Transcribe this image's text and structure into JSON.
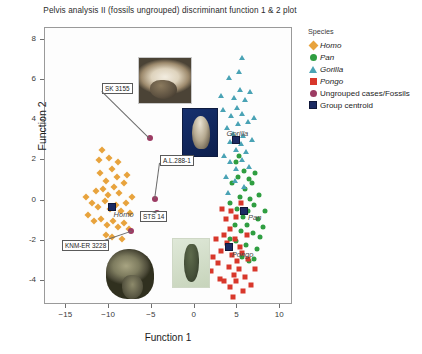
{
  "chart_data": {
    "type": "scatter",
    "title": "Pelvis analysis II (fossils ungrouped) discriminant function 1 & 2 plot",
    "xlabel": "Function 1",
    "ylabel": "Function 2",
    "xlim": [
      -17.5,
      11.5
    ],
    "ylim": [
      -5.2,
      8.6
    ],
    "xticks": [
      -15,
      -10,
      -5,
      0,
      5,
      10
    ],
    "yticks": [
      -4,
      -2,
      0,
      2,
      4,
      6,
      8
    ],
    "grid": false,
    "legend_position": "right",
    "legend_title": "Species",
    "series": [
      {
        "name": "Homo",
        "marker": "diamond",
        "color": "#e8a33d",
        "points": [
          [
            -10.9,
            1.35
          ],
          [
            -10.2,
            0.95
          ],
          [
            -9.6,
            1.55
          ],
          [
            -9.0,
            1.15
          ],
          [
            -11.4,
            0.45
          ],
          [
            -10.6,
            0.55
          ],
          [
            -10.0,
            0.25
          ],
          [
            -9.3,
            0.65
          ],
          [
            -8.7,
            0.35
          ],
          [
            -8.1,
            0.85
          ],
          [
            -11.9,
            -0.15
          ],
          [
            -11.2,
            -0.35
          ],
          [
            -10.4,
            -0.05
          ],
          [
            -9.8,
            -0.45
          ],
          [
            -9.1,
            -0.25
          ],
          [
            -8.5,
            -0.55
          ],
          [
            -7.9,
            -0.15
          ],
          [
            -7.4,
            -0.65
          ],
          [
            -11.6,
            -1.05
          ],
          [
            -10.8,
            -0.95
          ],
          [
            -10.1,
            -1.25
          ],
          [
            -9.4,
            -1.05
          ],
          [
            -8.8,
            -1.35
          ],
          [
            -8.2,
            -1.15
          ],
          [
            -7.6,
            -1.45
          ],
          [
            -12.3,
            -0.75
          ],
          [
            -9.9,
            2.05
          ],
          [
            -8.9,
            1.85
          ],
          [
            -10.7,
            2.45
          ],
          [
            -7.2,
            0.15
          ],
          [
            -12.6,
            0.15
          ],
          [
            -9.5,
            -1.85
          ],
          [
            -8.4,
            -1.95
          ],
          [
            -10.3,
            -1.75
          ],
          [
            -11.1,
            1.95
          ],
          [
            -7.8,
            1.25
          ]
        ]
      },
      {
        "name": "Pan",
        "marker": "circle",
        "color": "#2f9e41",
        "points": [
          [
            5.4,
            0.15
          ],
          [
            6.0,
            0.55
          ],
          [
            6.6,
            0.05
          ],
          [
            5.1,
            -0.45
          ],
          [
            5.8,
            -0.85
          ],
          [
            6.4,
            -0.55
          ],
          [
            7.0,
            -0.25
          ],
          [
            4.8,
            -1.25
          ],
          [
            5.5,
            -1.55
          ],
          [
            6.2,
            -1.25
          ],
          [
            6.9,
            -1.65
          ],
          [
            7.5,
            -0.95
          ],
          [
            4.5,
            0.85
          ],
          [
            5.2,
            1.15
          ],
          [
            5.9,
            1.45
          ],
          [
            6.5,
            1.05
          ],
          [
            7.2,
            1.35
          ],
          [
            4.2,
            -0.15
          ],
          [
            7.8,
            -1.85
          ],
          [
            6.1,
            -2.25
          ],
          [
            5.0,
            -2.05
          ],
          [
            7.4,
            -2.45
          ],
          [
            8.1,
            -1.35
          ],
          [
            4.9,
            1.85
          ],
          [
            6.8,
            0.85
          ],
          [
            7.6,
            0.25
          ],
          [
            5.6,
            -2.85
          ],
          [
            6.5,
            -3.05
          ],
          [
            8.4,
            -0.55
          ],
          [
            4.3,
            -1.95
          ],
          [
            7.1,
            -2.95
          ],
          [
            5.3,
            2.15
          ]
        ]
      },
      {
        "name": "Gorilla",
        "marker": "triangle",
        "color": "#4aa3b5",
        "points": [
          [
            4.6,
            3.25
          ],
          [
            5.2,
            3.75
          ],
          [
            5.8,
            3.15
          ],
          [
            4.2,
            2.85
          ],
          [
            4.9,
            2.45
          ],
          [
            5.5,
            2.75
          ],
          [
            6.1,
            2.35
          ],
          [
            4.4,
            4.15
          ],
          [
            5.1,
            4.55
          ],
          [
            5.7,
            4.25
          ],
          [
            6.3,
            3.85
          ],
          [
            3.9,
            3.55
          ],
          [
            4.7,
            5.05
          ],
          [
            5.4,
            5.45
          ],
          [
            6.0,
            4.95
          ],
          [
            3.6,
            2.15
          ],
          [
            4.3,
            1.85
          ],
          [
            5.0,
            1.55
          ],
          [
            5.6,
            1.95
          ],
          [
            6.5,
            1.65
          ],
          [
            4.1,
            6.05
          ],
          [
            5.3,
            6.35
          ],
          [
            3.4,
            4.45
          ],
          [
            6.8,
            2.95
          ],
          [
            4.8,
            0.95
          ],
          [
            5.9,
            0.65
          ],
          [
            3.2,
            5.15
          ],
          [
            6.6,
            5.35
          ],
          [
            4.0,
            0.35
          ],
          [
            5.7,
            7.05
          ],
          [
            7.1,
            4.05
          ],
          [
            3.8,
            1.15
          ]
        ]
      },
      {
        "name": "Pongo",
        "marker": "square",
        "color": "#d8372b",
        "points": [
          [
            4.2,
            -1.45
          ],
          [
            4.8,
            -1.95
          ],
          [
            5.4,
            -2.35
          ],
          [
            3.9,
            -2.15
          ],
          [
            4.5,
            -2.75
          ],
          [
            5.1,
            -3.05
          ],
          [
            5.7,
            -2.65
          ],
          [
            3.5,
            -1.75
          ],
          [
            4.1,
            -3.35
          ],
          [
            4.7,
            -3.75
          ],
          [
            5.3,
            -3.45
          ],
          [
            3.2,
            -2.55
          ],
          [
            3.8,
            -0.95
          ],
          [
            4.4,
            -0.55
          ],
          [
            5.0,
            -0.85
          ],
          [
            2.9,
            -3.15
          ],
          [
            3.6,
            -4.05
          ],
          [
            4.3,
            -4.35
          ],
          [
            5.0,
            -4.05
          ],
          [
            2.6,
            -1.95
          ],
          [
            6.0,
            -3.85
          ],
          [
            6.4,
            -2.95
          ],
          [
            3.3,
            -0.45
          ],
          [
            5.8,
            -4.55
          ],
          [
            2.3,
            -2.85
          ],
          [
            6.7,
            -4.25
          ],
          [
            4.6,
            -4.85
          ],
          [
            3.1,
            -3.95
          ],
          [
            7.2,
            -3.45
          ],
          [
            2.0,
            -3.55
          ],
          [
            5.5,
            -0.15
          ],
          [
            6.2,
            -1.75
          ]
        ]
      }
    ],
    "fossils": [
      {
        "label": "SK 3155",
        "x": -5.1,
        "y": 3.05
      },
      {
        "label": "A.L.288-1",
        "x": -4.5,
        "y": 0.05
      },
      {
        "label": "STS 14",
        "x": -4.3,
        "y": -0.65
      },
      {
        "label": "KNM-ER 3228",
        "x": -7.3,
        "y": -1.55
      }
    ],
    "centroids": [
      {
        "label": "Homo",
        "x": -9.6,
        "y": -0.35
      },
      {
        "label": "Pan",
        "x": 5.9,
        "y": -0.55
      },
      {
        "label": "Gorilla",
        "x": 4.9,
        "y": 2.95
      },
      {
        "label": "Pongo",
        "x": 4.1,
        "y": -2.35
      }
    ]
  },
  "legend": {
    "title": "Species",
    "items": [
      {
        "label": "Homo",
        "marker": "diamond-icon",
        "italic": true
      },
      {
        "label": "Pan",
        "marker": "circle-icon",
        "italic": true
      },
      {
        "label": "Gorilla",
        "marker": "triangle-icon",
        "italic": true
      },
      {
        "label": "Pongo",
        "marker": "square-icon",
        "italic": true
      },
      {
        "label": "Ungrouped cases/Fossils",
        "marker": "circle-icon",
        "italic": false
      },
      {
        "label": "Group centroid",
        "marker": "square-icon",
        "italic": false
      }
    ]
  },
  "photos": [
    {
      "name": "sk-3155-pelvis-photo",
      "caption": "SK 3155"
    },
    {
      "name": "al-288-1-pelvis-photo",
      "caption": "A.L.288-1"
    },
    {
      "name": "sts-14-pelvis-photo",
      "caption": "STS 14"
    },
    {
      "name": "knm-er-3228-pelvis-photo",
      "caption": "KNM-ER 3228"
    }
  ]
}
